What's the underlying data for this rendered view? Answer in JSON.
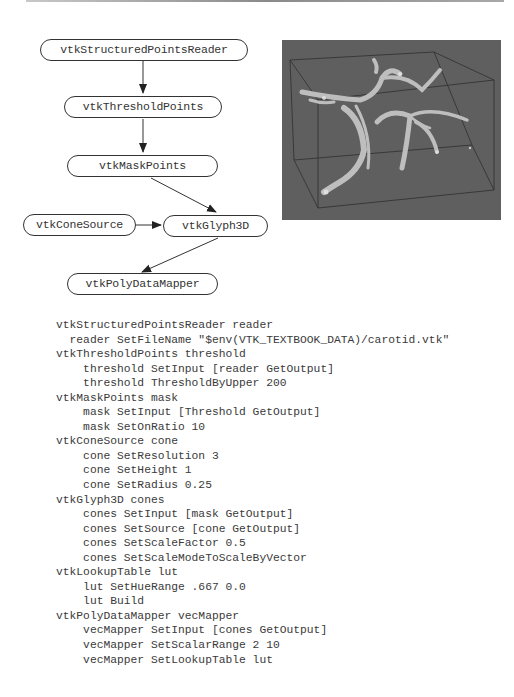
{
  "diagram": {
    "nodes": [
      {
        "id": "reader",
        "label": "vtkStructuredPointsReader"
      },
      {
        "id": "threshold",
        "label": "vtkThresholdPoints"
      },
      {
        "id": "mask",
        "label": "vtkMaskPoints"
      },
      {
        "id": "cone",
        "label": "vtkConeSource"
      },
      {
        "id": "glyph",
        "label": "vtkGlyph3D"
      },
      {
        "id": "mapper",
        "label": "vtkPolyDataMapper"
      }
    ],
    "edges": [
      {
        "from": "reader",
        "to": "threshold"
      },
      {
        "from": "threshold",
        "to": "mask"
      },
      {
        "from": "mask",
        "to": "glyph"
      },
      {
        "from": "cone",
        "to": "glyph"
      },
      {
        "from": "glyph",
        "to": "mapper"
      }
    ]
  },
  "rendering": {
    "description": "carotid artery glyph visualization inside bounding box",
    "background_color": "#5f5f5f"
  },
  "code": {
    "lines": [
      "vtkStructuredPointsReader reader",
      "  reader SetFileName \"$env(VTK_TEXTBOOK_DATA)/carotid.vtk\"",
      "vtkThresholdPoints threshold",
      "    threshold SetInput [reader GetOutput]",
      "    threshold ThresholdByUpper 200",
      "vtkMaskPoints mask",
      "    mask SetInput [Threshold GetOutput]",
      "    mask SetOnRatio 10",
      "vtkConeSource cone",
      "    cone SetResolution 3",
      "    cone SetHeight 1",
      "    cone SetRadius 0.25",
      "vtkGlyph3D cones",
      "    cones SetInput [mask GetOutput]",
      "    cones SetSource [cone GetOutput]",
      "    cones SetScaleFactor 0.5",
      "    cones SetScaleModeToScaleByVector",
      "vtkLookupTable lut",
      "    lut SetHueRange .667 0.0",
      "    lut Build",
      "vtkPolyDataMapper vecMapper",
      "    vecMapper SetInput [cones GetOutput]",
      "    vecMapper SetScalarRange 2 10",
      "    vecMapper SetLookupTable lut"
    ]
  }
}
